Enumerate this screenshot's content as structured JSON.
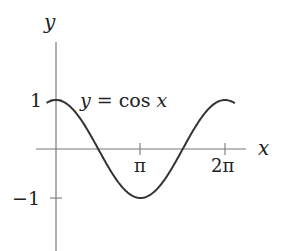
{
  "chart_data": {
    "type": "line",
    "title": "",
    "xlabel": "x",
    "ylabel": "y",
    "annotation": "y = cos x",
    "x_ticks": [
      {
        "value": 3.14159,
        "label": "π"
      },
      {
        "value": 6.28319,
        "label": "2π"
      }
    ],
    "y_ticks": [
      {
        "value": 1,
        "label": "1"
      },
      {
        "value": -1,
        "label": "−1"
      }
    ],
    "xlim": [
      -0.7,
      7.3
    ],
    "ylim": [
      -2.1,
      2.2
    ],
    "grid": false,
    "legend": null,
    "series": [
      {
        "name": "y = cos x",
        "function": "cos(x)",
        "x_range": [
          -0.35,
          6.65
        ],
        "color": "#333333"
      }
    ]
  },
  "labels": {
    "y_axis": "y",
    "x_axis": "x",
    "func_lhs": "y",
    "func_eq": " = cos ",
    "func_var": "x",
    "tick_pi": "π",
    "tick_2pi": "2π",
    "tick_1": "1",
    "tick_neg1": "−1"
  },
  "colors": {
    "axis": "#777777",
    "curve": "#333333",
    "text": "#222222"
  }
}
